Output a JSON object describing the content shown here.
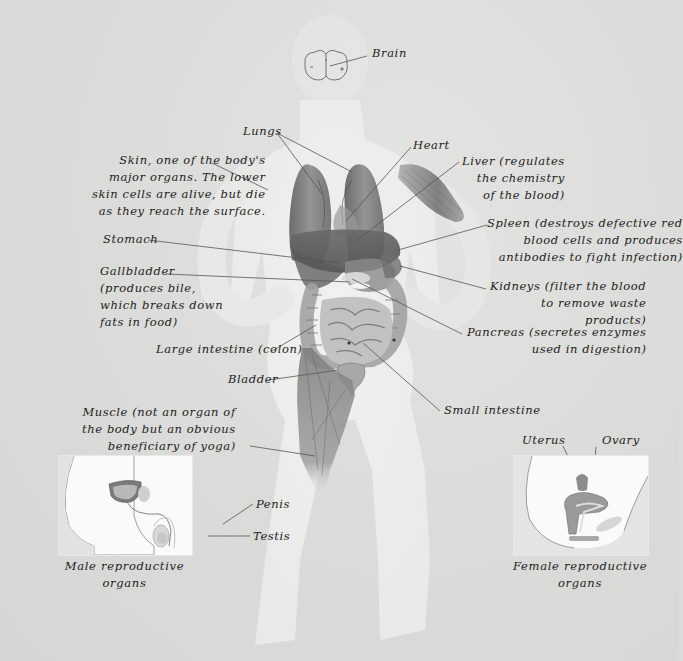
{
  "diagram": {
    "type": "anatomical-illustration",
    "background_color": "#dcdcda",
    "label_color": "#222222",
    "leader_line_color": "#555555"
  },
  "labels": {
    "brain": "Brain",
    "lungs": "Lungs",
    "heart": "Heart",
    "skin": "Skin, one of the body's\nmajor organs. The lower\nskin cells are alive, but die\nas they reach the surface.",
    "liver": "Liver (regulates\nthe chemistry\nof the blood)",
    "spleen": "Spleen (destroys defective red\nblood cells and produces\nantibodies to fight infection)",
    "stomach": "Stomach",
    "gallbladder": "Gallbladder\n(produces bile,\nwhich breaks down\nfats in food)",
    "kidneys": "Kidneys (filter the blood\nto remove waste\nproducts)",
    "pancreas": "Pancreas (secretes enzymes\nused in digestion)",
    "large_intestine": "Large intestine (colon)",
    "bladder": "Bladder",
    "small_intestine": "Small intestine",
    "muscle": "Muscle (not an organ of\nthe body but an obvious\nbeneficiary of yoga)"
  },
  "insets": {
    "male": {
      "caption": "Male reproductive\norgans",
      "labels": {
        "penis": "Penis",
        "testis": "Testis"
      }
    },
    "female": {
      "caption": "Female reproductive\norgans",
      "labels": {
        "uterus": "Uterus",
        "ovary": "Ovary"
      }
    }
  }
}
